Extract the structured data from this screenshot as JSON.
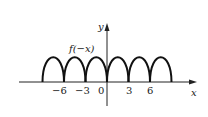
{
  "chart_data": {
    "type": "line",
    "title": "",
    "curve_label": "f(−x)",
    "xlabel": "x",
    "ylabel": "y",
    "x_ticks": [
      {
        "value": -6,
        "label": "−6"
      },
      {
        "value": -3,
        "label": "−3"
      },
      {
        "value": 0,
        "label": "0"
      },
      {
        "value": 3,
        "label": "3"
      },
      {
        "value": 6,
        "label": "6"
      }
    ],
    "arches": [
      {
        "x_start": -9,
        "x_end": -6
      },
      {
        "x_start": -6,
        "x_end": -3
      },
      {
        "x_start": -3,
        "x_end": 0
      },
      {
        "x_start": 0,
        "x_end": 3
      },
      {
        "x_start": 3,
        "x_end": 6
      },
      {
        "x_start": 6,
        "x_end": 9
      }
    ],
    "x_range": [
      -13,
      13
    ],
    "grid": false,
    "legend": "none"
  },
  "labels": {
    "curve": "f(−x)",
    "x_axis": "x",
    "y_axis": "y",
    "tick_m6": "−6",
    "tick_m3": "−3",
    "tick_0": "0",
    "tick_3": "3",
    "tick_6": "6"
  }
}
